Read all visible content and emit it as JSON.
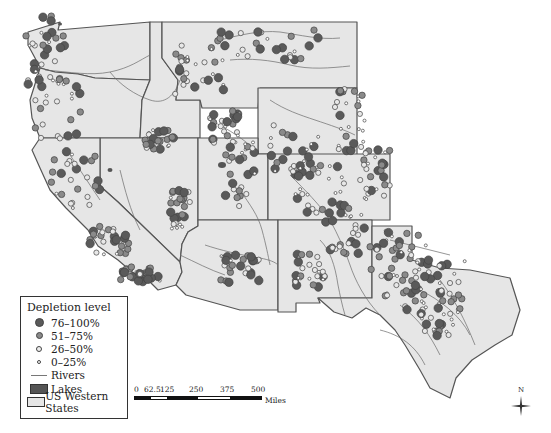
{
  "map": {
    "title": "",
    "colors": {
      "state_fill": "#e6e6e6",
      "state_border": "#555555",
      "river": "#6a6a6a",
      "lake": "#555555",
      "class_76_100": "#5a5a5a",
      "class_51_75": "#8a8a8a",
      "class_26_50": "#e8e8e8",
      "class_0_25": "#ffffff"
    },
    "states": [
      "Washington",
      "Oregon",
      "California",
      "Idaho",
      "Nevada",
      "Montana",
      "Wyoming",
      "Utah",
      "Colorado",
      "Arizona",
      "New Mexico",
      "Texas"
    ]
  },
  "legend": {
    "title": "Depletion level",
    "items": [
      {
        "label": "76–100%",
        "symbol": "large-dark-circle"
      },
      {
        "label": "51–75%",
        "symbol": "medium-gray-circle"
      },
      {
        "label": "26–50%",
        "symbol": "small-light-circle"
      },
      {
        "label": "0–25%",
        "symbol": "tiny-white-circle"
      },
      {
        "label": "Rivers",
        "symbol": "line"
      },
      {
        "label": "Lakes",
        "symbol": "dark-rect"
      },
      {
        "label": "US Western States",
        "symbol": "light-rect"
      }
    ]
  },
  "scale_bar": {
    "ticks": [
      "0",
      "62.5",
      "125",
      "250",
      "375",
      "500"
    ],
    "unit": "Miles"
  },
  "north_arrow": {
    "label": "N"
  }
}
